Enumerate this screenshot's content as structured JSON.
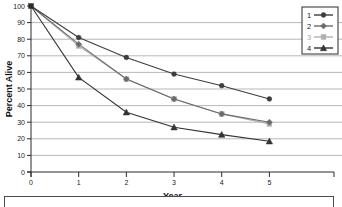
{
  "chart_data": {
    "type": "line",
    "title": "",
    "xlabel": "Year",
    "ylabel": "Percent Alive",
    "x": [
      0,
      1,
      2,
      3,
      4,
      5
    ],
    "xlim": [
      0,
      5.6
    ],
    "ylim": [
      0,
      100
    ],
    "xticks": [
      "0",
      "1",
      "2",
      "3",
      "4",
      "5"
    ],
    "yticks": [
      "0",
      "10",
      "20",
      "30",
      "40",
      "50",
      "60",
      "70",
      "80",
      "90",
      "100"
    ],
    "grid": "horizontal",
    "legend_position": "top-right",
    "series": [
      {
        "name": "1",
        "marker": "circle",
        "color": "#3d3d3d",
        "values": [
          100,
          81,
          69,
          59,
          52,
          44
        ]
      },
      {
        "name": "2",
        "marker": "diamond",
        "color": "#6b6b6b",
        "values": [
          100,
          77,
          56,
          44,
          35,
          30
        ]
      },
      {
        "name": "3",
        "marker": "square",
        "color": "#b0b0b0",
        "values": [
          100,
          76,
          56,
          44,
          35,
          29
        ]
      },
      {
        "name": "4",
        "marker": "triangle",
        "color": "#333333",
        "values": [
          100,
          57,
          36,
          27,
          22.5,
          18.5
        ]
      }
    ]
  },
  "legend": {
    "entries": [
      {
        "label": "1"
      },
      {
        "label": "2"
      },
      {
        "label": "3"
      },
      {
        "label": "4"
      }
    ]
  },
  "axes": {
    "x_title": "Year",
    "y_title": "Percent Alive"
  },
  "caption": {
    "text": ""
  }
}
